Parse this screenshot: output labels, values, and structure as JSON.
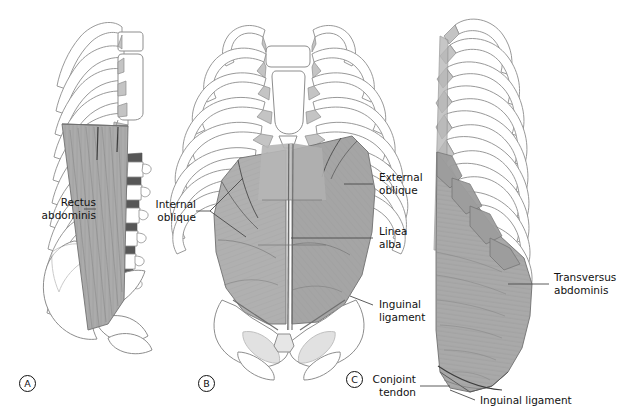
{
  "figure": {
    "background": "#ffffff",
    "ink": "#111111"
  },
  "palette": {
    "outline": "#8d8d8d",
    "bone_fill": "#ffffff",
    "bone_shadow": "#cfcfcf",
    "cartilage": "#c4c4c4",
    "muscle_light": "#bdbdbd",
    "muscle_mid": "#ababab",
    "muscle_dark": "#9a9a9a",
    "striation": "#8e8e8e",
    "leader": "#4a4a4a"
  },
  "panels": [
    {
      "id": "A",
      "mark": "A",
      "view": "lateral-sagittal",
      "muscle": "rectus abdominis"
    },
    {
      "id": "B",
      "mark": "B",
      "view": "anterior",
      "muscle": "external and internal oblique"
    },
    {
      "id": "C",
      "mark": "C",
      "view": "oblique-lateral",
      "muscle": "transversus abdominis"
    }
  ],
  "labels": [
    {
      "id": "rectus-abdominis",
      "line1": "Rectus",
      "line2": "abdominis",
      "panel": "A"
    },
    {
      "id": "internal-oblique",
      "line1": "Internal",
      "line2": "oblique",
      "panel": "B"
    },
    {
      "id": "external-oblique",
      "line1": "External",
      "line2": "oblique",
      "panel": "B"
    },
    {
      "id": "linea-alba",
      "line1": "Linea",
      "line2": "alba",
      "panel": "B"
    },
    {
      "id": "inguinal-ligament-b",
      "line1": "Inguinal",
      "line2": "ligament",
      "panel": "B"
    },
    {
      "id": "transversus-abdominis",
      "line1": "Transversus",
      "line2": "abdominis",
      "panel": "C"
    },
    {
      "id": "conjoint-tendon",
      "line1": "Conjoint",
      "line2": "tendon",
      "panel": "C"
    },
    {
      "id": "inguinal-ligament-c",
      "line1": "Inguinal ligament",
      "line2": "",
      "panel": "C"
    }
  ]
}
